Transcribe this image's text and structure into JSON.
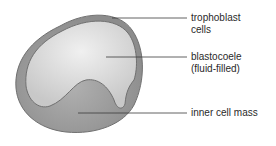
{
  "diagram": {
    "labels": [
      {
        "id": "trophoblast",
        "line1": "trophoblast",
        "line2": "cells"
      },
      {
        "id": "blastocoele",
        "line1": "blastocoele",
        "line2": "(fluid-filled)"
      },
      {
        "id": "inner-cell-mass",
        "line1": "inner cell mass",
        "line2": ""
      }
    ],
    "colors": {
      "outer_wall": "#8f8f8f",
      "outer_edge": "#6e6e6e",
      "cavity": "#d8d8d8",
      "cavity_highlight": "#efefef",
      "inner_mass": "#a8a8a8",
      "leader_line": "#3a3a3a",
      "text": "#2a2a2a"
    }
  }
}
